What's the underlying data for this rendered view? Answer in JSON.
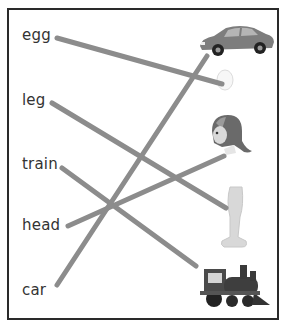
{
  "worksheet": {
    "words": [
      {
        "label": "egg",
        "x": 22,
        "y": 26
      },
      {
        "label": "leg",
        "x": 22,
        "y": 91
      },
      {
        "label": "train",
        "x": 22,
        "y": 155
      },
      {
        "label": "head",
        "x": 22,
        "y": 216
      },
      {
        "label": "car",
        "x": 22,
        "y": 281
      }
    ],
    "pictures": [
      {
        "name": "car",
        "x": 196,
        "y": 20
      },
      {
        "name": "egg",
        "x": 215,
        "y": 67
      },
      {
        "name": "girl-head",
        "x": 206,
        "y": 113
      },
      {
        "name": "leg",
        "x": 218,
        "y": 185
      },
      {
        "name": "train",
        "x": 196,
        "y": 263
      }
    ],
    "line_color": "#8c8c8c",
    "matches": [
      {
        "word": "egg",
        "picture": "egg",
        "x1": 57,
        "y1": 38,
        "x2": 222,
        "y2": 84
      },
      {
        "word": "leg",
        "picture": "leg",
        "x1": 52,
        "y1": 103,
        "x2": 226,
        "y2": 208
      },
      {
        "word": "train",
        "picture": "train",
        "x1": 62,
        "y1": 168,
        "x2": 196,
        "y2": 266
      },
      {
        "word": "head",
        "picture": "head",
        "x1": 68,
        "y1": 226,
        "x2": 224,
        "y2": 156
      },
      {
        "word": "car",
        "picture": "car",
        "x1": 57,
        "y1": 285,
        "x2": 207,
        "y2": 56
      }
    ]
  }
}
